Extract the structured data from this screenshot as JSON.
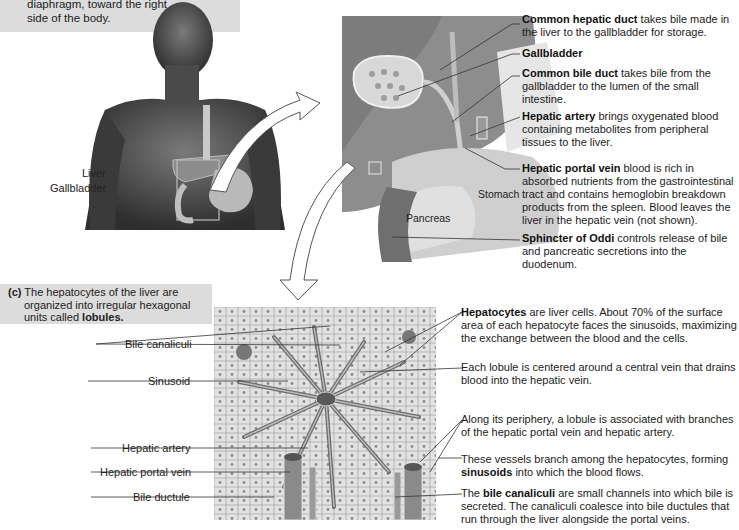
{
  "panel_a": {
    "caption_line1_partial": "diaphragm, toward the right",
    "caption_line2": "side of the body.",
    "labels": {
      "liver": "Liver",
      "gallbladder": "Gallbladder"
    }
  },
  "panel_b": {
    "organ_labels": {
      "stomach": "Stomach",
      "pancreas": "Pancreas"
    },
    "callouts": [
      {
        "term": "Common hepatic duct",
        "text": " takes bile made in the liver to the gallbladder for storage."
      },
      {
        "term": "Gallbladder",
        "text": ""
      },
      {
        "term": "Common bile duct",
        "text": " takes bile from the gallbladder to the lumen of the small intestine."
      },
      {
        "term": "Hepatic artery",
        "text": " brings oxygenated blood containing metabolites from peripheral tissues to the liver."
      },
      {
        "term": "Hepatic portal vein",
        "text": " blood is rich in absorbed nutrients from the gastrointestinal tract and contains hemoglobin breakdown products from the spleen. Blood leaves the liver in the hepatic vein (not shown)."
      },
      {
        "term": "Sphincter of Oddi",
        "text": " controls release of bile and pancreatic secretions into the duodenum."
      }
    ]
  },
  "panel_c": {
    "caption_prefix": "(c)",
    "caption_text": " The hepatocytes of the liver are organized into irregular hexagonal units called ",
    "caption_bold": "lobules.",
    "left_labels": {
      "bile_canaliculi": "Bile canaliculi",
      "sinusoid": "Sinusoid",
      "hepatic_artery": "Hepatic artery",
      "hepatic_portal_vein": "Hepatic portal vein",
      "bile_ductule": "Bile ductule"
    },
    "right_callouts": [
      {
        "pre": "",
        "term": "Hepatocytes",
        "post": " are liver cells. About 70% of the surface area of each hepatocyte faces the sinusoids, maximizing the exchange between the blood and the cells."
      },
      {
        "pre": "Each lobule is centered around a central vein that drains blood into the hepatic vein.",
        "term": "",
        "post": ""
      },
      {
        "pre": "Along its periphery, a lobule is associated with branches of the hepatic portal vein and hepatic artery.",
        "term": "",
        "post": ""
      },
      {
        "pre": "These vessels branch among the hepatocytes, forming ",
        "term": "sinusoids",
        "post": " into which the blood flows."
      },
      {
        "pre": "The ",
        "term": "bile canaliculi",
        "post": " are small channels into which bile is secreted. The canaliculi coalesce into bile ductules that run through the liver alongside the portal veins."
      }
    ]
  }
}
